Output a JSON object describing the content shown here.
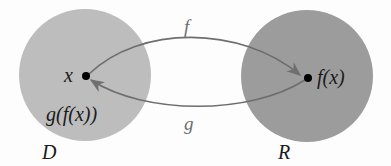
{
  "diagram": {
    "type": "function-composition-mapping",
    "domain_set": {
      "label": "D",
      "color": "#bdbdbd"
    },
    "range_set": {
      "label": "R",
      "color": "#9c9c9c"
    },
    "points": [
      {
        "id": "x",
        "label": "x",
        "set": "D"
      },
      {
        "id": "fx",
        "label": "f(x)",
        "set": "R"
      }
    ],
    "composite_label": "g(f(x))",
    "arrows": [
      {
        "label": "f",
        "from": "x",
        "to": "f(x)",
        "direction": "D to R"
      },
      {
        "label": "g",
        "from": "f(x)",
        "to": "x",
        "direction": "R to D"
      }
    ],
    "arrow_color": "#6e6e6e",
    "dot_color": "#000000"
  }
}
